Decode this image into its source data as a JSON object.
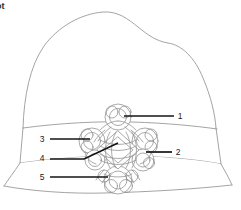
{
  "figure": {
    "caption": "ot",
    "title_visible_fragment": "ot",
    "line_color": "#9a9a9a",
    "knot_color": "#8e8e8e",
    "leader_color": "#141414",
    "background_color": "#ffffff"
  },
  "callouts": [
    {
      "id": "callout-1",
      "label": "1",
      "label_x": 180,
      "label_y": 119,
      "line_x1": 124,
      "line_y1": 116,
      "line_x2": 174,
      "line_y2": 116,
      "side": "right"
    },
    {
      "id": "callout-2",
      "label": "2",
      "label_x": 178,
      "label_y": 155,
      "line_x1": 146,
      "line_y1": 152,
      "line_x2": 172,
      "line_y2": 152,
      "side": "right"
    },
    {
      "id": "callout-3",
      "label": "3",
      "label_x": 42,
      "label_y": 142,
      "line_x1": 50,
      "line_y1": 139,
      "line_x2": 90,
      "line_y2": 139,
      "side": "left"
    },
    {
      "id": "callout-4",
      "label": "4",
      "label_x": 42,
      "label_y": 161,
      "line_x1": 50,
      "line_y1": 159,
      "line_x2": 84,
      "line_y2": 159,
      "side": "left"
    },
    {
      "id": "callout-5",
      "label": "5",
      "label_x": 42,
      "label_y": 180,
      "line_x1": 50,
      "line_y1": 177,
      "line_x2": 108,
      "line_y2": 177,
      "side": "left"
    }
  ],
  "callout_4_diagonal": {
    "x1": 84,
    "y1": 159,
    "x2": 118,
    "y2": 143
  },
  "hat": {
    "crown_peak_x": 110,
    "crown_top_y": 12,
    "band_top_y": 126,
    "band_bottom_y": 166,
    "brim_bottom_y": 200,
    "left_edge_x": 22,
    "right_edge_x": 218
  },
  "knot": {
    "center_x": 118,
    "center_y": 150,
    "type": "celtic-interlace",
    "lobes": 5
  }
}
